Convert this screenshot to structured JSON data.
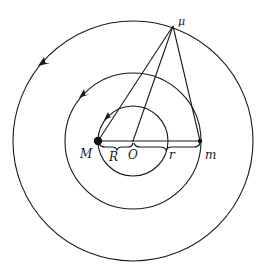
{
  "diagram": {
    "type": "orbital-three-body",
    "stroke_color": "#1a1a1a",
    "center": {
      "label": "O",
      "x": 133,
      "y": 141
    },
    "circles": [
      {
        "name": "outer-orbit",
        "r": 120,
        "arrow_direction": "counterclockwise"
      },
      {
        "name": "middle-orbit",
        "r": 68,
        "arrow_direction": "counterclockwise"
      },
      {
        "name": "inner-orbit",
        "r": 35,
        "arrow_direction": "counterclockwise"
      }
    ],
    "points": [
      {
        "label": "M",
        "x": 98,
        "y": 141,
        "size": "large"
      },
      {
        "label": "m",
        "x": 200,
        "y": 141,
        "size": "small"
      },
      {
        "label": "μ",
        "x": 173,
        "y": 26,
        "size": "none"
      }
    ],
    "segments": [
      {
        "from": "μ",
        "to": "M"
      },
      {
        "from": "μ",
        "to": "O"
      },
      {
        "from": "μ",
        "to": "m"
      },
      {
        "from": "M",
        "to": "m"
      }
    ],
    "braces": [
      {
        "label": "R",
        "from": "M",
        "to": "O"
      },
      {
        "label": "r",
        "from": "O",
        "to": "m"
      }
    ]
  },
  "labels": {
    "M": "M",
    "m": "m",
    "mu": "μ",
    "O": "O",
    "R": "R",
    "r": "r"
  }
}
